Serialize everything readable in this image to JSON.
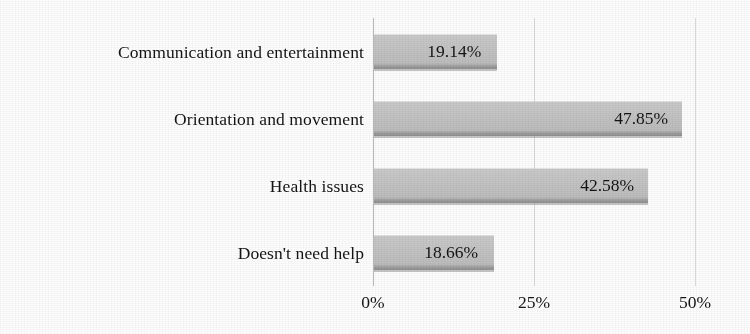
{
  "chart_data": {
    "type": "bar",
    "orientation": "horizontal",
    "title": "",
    "subtitle": "",
    "xlabel": "",
    "ylabel": "",
    "categories": [
      "Communication and entertainment",
      "Orientation and movement",
      "Health issues",
      "Doesn't need help"
    ],
    "values": [
      19.14,
      47.85,
      42.58,
      18.66
    ],
    "data_labels": [
      "19.14%",
      "47.85%",
      "42.58%",
      "18.66%"
    ],
    "xlim": [
      0,
      50
    ],
    "xticks": [
      0,
      25,
      50
    ],
    "xtick_labels": [
      "0%",
      "25%",
      "50%"
    ],
    "grid": "vertical",
    "legend": null,
    "series": [
      {
        "name": "Share of respondents",
        "values": [
          19.14,
          47.85,
          42.58,
          18.66
        ]
      }
    ]
  },
  "style": {
    "bar_fill": "#c3c3c3",
    "bar_edge": "#8c8c8c",
    "gridline": "#d9d9d9",
    "axis_line": "#b9b9b9",
    "text": "#141414",
    "background": "#fdfdfd"
  }
}
